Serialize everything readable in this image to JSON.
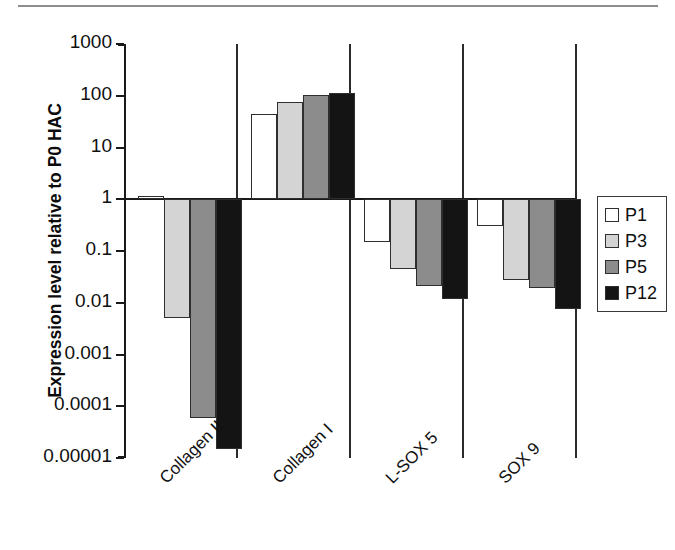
{
  "figure": {
    "has_top_rule": true,
    "background": "#ffffff"
  },
  "chart_data": {
    "type": "bar",
    "title": "",
    "subtitle": "",
    "xlabel": "",
    "ylabel": "Expression level relative to P0 HAC",
    "yscale": "log",
    "ylim": [
      1e-05,
      1000
    ],
    "ytick_labels": [
      "1000",
      "100",
      "10",
      "1",
      "0.1",
      "0.01",
      "0.001",
      "0.0001",
      "0.00001"
    ],
    "ytick_values": [
      1000,
      100,
      10,
      1,
      0.1,
      0.01,
      0.001,
      0.0001,
      1e-05
    ],
    "baseline": 1,
    "grid": false,
    "group_separators": true,
    "legend_position": "right",
    "categories": [
      "Collagen II",
      "Collagen I",
      "L-SOX 5",
      "SOX 9"
    ],
    "series": [
      {
        "name": "P1",
        "color": "#ffffff",
        "values": [
          1.15,
          45,
          0.15,
          0.3
        ]
      },
      {
        "name": "P3",
        "color": "#d4d4d4",
        "values": [
          0.005,
          75,
          0.045,
          0.027
        ]
      },
      {
        "name": "P5",
        "color": "#8c8c8c",
        "values": [
          6e-05,
          105,
          0.021,
          0.019
        ]
      },
      {
        "name": "P12",
        "color": "#141414",
        "values": [
          1.5e-05,
          112,
          0.012,
          0.0075
        ]
      }
    ]
  },
  "legend": {
    "entries": [
      {
        "label": "P1",
        "color": "#ffffff"
      },
      {
        "label": "P3",
        "color": "#d4d4d4"
      },
      {
        "label": "P5",
        "color": "#8c8c8c"
      },
      {
        "label": "P12",
        "color": "#141414"
      }
    ]
  }
}
